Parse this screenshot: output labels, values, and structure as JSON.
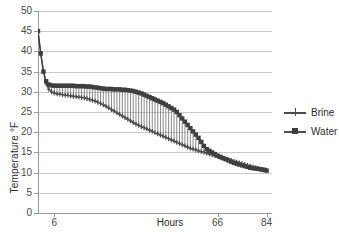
{
  "chart_data": {
    "type": "line",
    "title": "",
    "xlabel": "Hours",
    "ylabel": "Temperature °F",
    "xlim": [
      0,
      86
    ],
    "ylim": [
      0,
      50
    ],
    "ytick_values": [
      0,
      5,
      10,
      15,
      20,
      25,
      30,
      35,
      40,
      45,
      50
    ],
    "ytick_labels": [
      "0",
      "5",
      "10",
      "15",
      "20",
      "25",
      "30",
      "35",
      "40",
      "45",
      "50"
    ],
    "xtick_values": [
      6,
      66,
      84
    ],
    "xtick_labels": [
      "6",
      "66",
      "84"
    ],
    "grid": "horizontal",
    "legend_position": "right",
    "series": [
      {
        "name": "Brine",
        "marker": "cross",
        "color": "#4d4d4d",
        "x": [
          0,
          1,
          2,
          3,
          4,
          5,
          6,
          7,
          8,
          9,
          10,
          11,
          12,
          13,
          14,
          15,
          16,
          17,
          18,
          19,
          20,
          21,
          22,
          23,
          24,
          25,
          26,
          27,
          28,
          29,
          30,
          31,
          32,
          33,
          34,
          35,
          36,
          37,
          38,
          39,
          40,
          41,
          42,
          43,
          44,
          45,
          46,
          47,
          48,
          49,
          50,
          51,
          52,
          53,
          54,
          55,
          56,
          57,
          58,
          59,
          60,
          61,
          62,
          63,
          64,
          65,
          66,
          67,
          68,
          69,
          70,
          71,
          72,
          73,
          74,
          75,
          76,
          77,
          78,
          79,
          80,
          81,
          82,
          83,
          84
        ],
        "values": [
          45.0,
          39.5,
          35.0,
          32.0,
          30.6,
          30.0,
          29.7,
          29.5,
          29.4,
          29.3,
          29.2,
          29.1,
          29.0,
          28.9,
          28.8,
          28.7,
          28.6,
          28.5,
          28.3,
          28.1,
          27.9,
          27.7,
          27.4,
          27.1,
          26.8,
          26.4,
          26.0,
          25.6,
          25.2,
          24.8,
          24.4,
          24.0,
          23.6,
          23.2,
          22.8,
          22.4,
          22.0,
          21.7,
          21.4,
          21.1,
          20.8,
          20.5,
          20.2,
          19.9,
          19.6,
          19.3,
          19.0,
          18.7,
          18.4,
          18.1,
          17.8,
          17.5,
          17.2,
          16.9,
          16.6,
          16.3,
          16.0,
          15.8,
          15.6,
          15.4,
          15.2,
          15.0,
          14.8,
          14.6,
          14.4,
          14.2,
          14.0,
          13.8,
          13.6,
          13.4,
          13.2,
          13.0,
          12.8,
          12.6,
          12.4,
          12.2,
          12.0,
          11.8,
          11.6,
          11.4,
          11.2,
          11.0,
          10.8,
          10.6,
          10.5
        ]
      },
      {
        "name": "Water",
        "marker": "square",
        "color": "#3f3f3f",
        "x": [
          0,
          1,
          2,
          3,
          4,
          5,
          6,
          7,
          8,
          9,
          10,
          11,
          12,
          13,
          14,
          15,
          16,
          17,
          18,
          19,
          20,
          21,
          22,
          23,
          24,
          25,
          26,
          27,
          28,
          29,
          30,
          31,
          32,
          33,
          34,
          35,
          36,
          37,
          38,
          39,
          40,
          41,
          42,
          43,
          44,
          45,
          46,
          47,
          48,
          49,
          50,
          51,
          52,
          53,
          54,
          55,
          56,
          57,
          58,
          59,
          60,
          61,
          62,
          63,
          64,
          65,
          66,
          67,
          68,
          69,
          70,
          71,
          72,
          73,
          74,
          75,
          76,
          77,
          78,
          79,
          80,
          81,
          82,
          83,
          84
        ],
        "values": [
          45.0,
          39.5,
          35.0,
          32.6,
          31.8,
          31.6,
          31.5,
          31.5,
          31.5,
          31.5,
          31.5,
          31.5,
          31.5,
          31.5,
          31.4,
          31.4,
          31.4,
          31.4,
          31.3,
          31.3,
          31.2,
          31.1,
          31.0,
          30.9,
          30.8,
          30.7,
          30.7,
          30.7,
          30.6,
          30.6,
          30.6,
          30.5,
          30.5,
          30.4,
          30.3,
          30.2,
          30.0,
          29.8,
          29.6,
          29.3,
          29.0,
          28.7,
          28.4,
          28.1,
          27.8,
          27.5,
          27.2,
          26.8,
          26.4,
          26.0,
          25.6,
          25.0,
          24.2,
          23.4,
          22.6,
          21.8,
          21.0,
          20.2,
          19.4,
          18.6,
          17.6,
          16.6,
          15.8,
          15.4,
          15.0,
          14.6,
          14.2,
          13.9,
          13.6,
          13.3,
          13.0,
          12.7,
          12.4,
          12.2,
          12.0,
          11.8,
          11.6,
          11.4,
          11.2,
          11.1,
          11.0,
          10.9,
          10.8,
          10.7,
          10.5
        ]
      }
    ]
  },
  "legend": {
    "items": [
      {
        "label": "Brine"
      },
      {
        "label": "Water"
      }
    ]
  }
}
